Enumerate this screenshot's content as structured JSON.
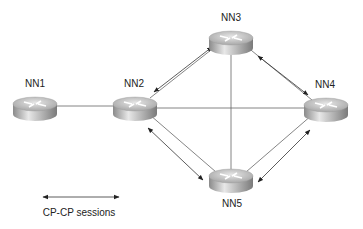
{
  "diagram": {
    "nodes": [
      {
        "id": "NN1",
        "label": "NN1",
        "x": 35,
        "y": 106
      },
      {
        "id": "NN2",
        "label": "NN2",
        "x": 135,
        "y": 106
      },
      {
        "id": "NN3",
        "label": "NN3",
        "x": 231,
        "y": 40
      },
      {
        "id": "NN4",
        "label": "NN4",
        "x": 326,
        "y": 107
      },
      {
        "id": "NN5",
        "label": "NN5",
        "x": 231,
        "y": 180
      }
    ],
    "links": [
      {
        "from": "NN1",
        "to": "NN2",
        "type": "link"
      },
      {
        "from": "NN2",
        "to": "NN4",
        "type": "link"
      },
      {
        "from": "NN3",
        "to": "NN5",
        "type": "link"
      },
      {
        "from": "NN2",
        "to": "NN3",
        "type": "link+cp-cp"
      },
      {
        "from": "NN3",
        "to": "NN4",
        "type": "link+cp-cp"
      },
      {
        "from": "NN2",
        "to": "NN5",
        "type": "link+cp-cp"
      },
      {
        "from": "NN5",
        "to": "NN4",
        "type": "link+cp-cp"
      }
    ],
    "legend": {
      "label": "CP-CP sessions",
      "symbol": "double-headed-arrow"
    },
    "colors": {
      "line": "#555555",
      "router_top": "#d8d8d8",
      "router_side": "#9a9a9a"
    }
  }
}
